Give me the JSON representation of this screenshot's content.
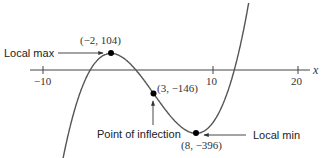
{
  "chart_data": {
    "type": "line",
    "title": "",
    "function": "f(x) = x^3 - 9x^2 - 48x + 52",
    "xlabel": "x",
    "ylabel": "",
    "x_ticks": [
      -10,
      10,
      20
    ],
    "x_tick_labels": [
      "−10",
      "10",
      "20"
    ],
    "xlim": [
      -12.5,
      23
    ],
    "ylim": [
      -550,
      440
    ],
    "grid": false,
    "legend": null,
    "series": [
      {
        "name": "f(x)",
        "x": [
          -8,
          -6,
          -4,
          -2,
          0,
          2,
          3,
          4,
          6,
          8,
          10,
          12,
          14
        ],
        "y": [
          -508,
          -128,
          68,
          104,
          52,
          -16,
          -146,
          -140,
          -272,
          -396,
          -328,
          -236,
          220
        ]
      }
    ],
    "points": [
      {
        "x": -2,
        "y": 104,
        "label": "(−2, 104)"
      },
      {
        "x": 3,
        "y": -146,
        "label": "(3, −146)"
      },
      {
        "x": 8,
        "y": -396,
        "label": "(8, −396)"
      }
    ],
    "annotations": [
      {
        "text": "Local max",
        "target": "(−2, 104)"
      },
      {
        "text": "Point of inflection",
        "target": "(3, −146)"
      },
      {
        "text": "Local min",
        "target": "(8, −396)"
      }
    ]
  },
  "labels": {
    "x_axis_var": "x",
    "tick_neg10": "−10",
    "tick_10": "10",
    "tick_20": "20",
    "max_point": "(−2, 104)",
    "inflection_point": "(3, −146)",
    "min_point": "(8, −396)",
    "local_max": "Local max",
    "inflection": "Point of inflection",
    "local_min": "Local min"
  }
}
